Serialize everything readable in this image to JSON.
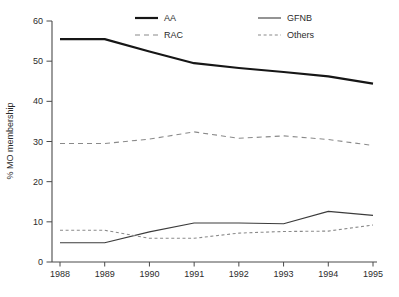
{
  "chart_data": {
    "type": "line",
    "title": "",
    "xlabel": "",
    "ylabel": "% MO membership",
    "x": [
      1988,
      1989,
      1990,
      1991,
      1992,
      1993,
      1994,
      1995
    ],
    "ylim": [
      0,
      60
    ],
    "yticks": [
      0,
      10,
      20,
      30,
      40,
      50,
      60
    ],
    "grid": false,
    "legend_position": "top-inside-two-columns",
    "series": [
      {
        "name": "AA",
        "line_style": "solid-thick",
        "color": "#161616",
        "values": [
          55.5,
          55.5,
          52.4,
          49.5,
          48.3,
          47.3,
          46.2,
          44.4
        ]
      },
      {
        "name": "RAC",
        "line_style": "dashed",
        "color": "#8a8a8a",
        "values": [
          29.5,
          29.5,
          30.6,
          32.4,
          30.8,
          31.4,
          30.5,
          29.0
        ]
      },
      {
        "name": "GFNB",
        "line_style": "solid-thin",
        "color": "#3c3c3c",
        "values": [
          4.8,
          4.8,
          7.5,
          9.7,
          9.7,
          9.5,
          12.6,
          11.6
        ]
      },
      {
        "name": "Others",
        "line_style": "dashed-fine",
        "color": "#8a8a8a",
        "values": [
          7.9,
          7.9,
          5.9,
          5.9,
          7.2,
          7.6,
          7.7,
          9.2
        ]
      }
    ]
  },
  "colors": {
    "background": "#ffffff",
    "axis": "#4a4a4a",
    "tick_text": "#2b2b2b"
  }
}
